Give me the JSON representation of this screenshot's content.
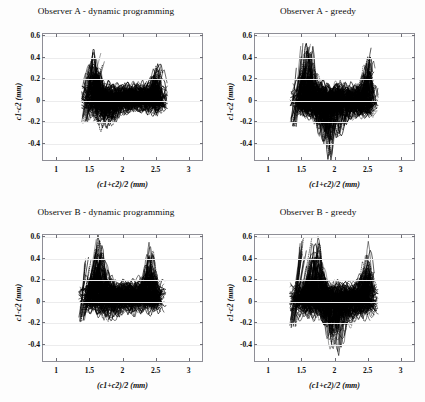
{
  "figure": {
    "background": "#fdfdfd",
    "rows": 2,
    "cols": 2
  },
  "axes": {
    "xlabel": "(c1+c2)/2 (mm)",
    "ylabel": "c1-c2 (mm)",
    "xticks": [
      "1",
      "1.5",
      "2",
      "2.5",
      "3"
    ],
    "xtick_values": [
      1,
      1.5,
      2,
      2.5,
      3
    ],
    "yticks": [
      "0.6",
      "0.4",
      "0.2",
      "0",
      "-0.2",
      "-0.4"
    ],
    "ytick_values": [
      0.6,
      0.4,
      0.2,
      0,
      -0.2,
      -0.4
    ],
    "xlim": [
      0.8,
      3.2
    ],
    "ylim": [
      -0.55,
      0.62
    ],
    "grid": true,
    "grid_color": "#ececed",
    "frame_color": "#8e8e96",
    "series_color": "#000000"
  },
  "chart_data": [
    {
      "type": "scatter",
      "panel": "top-left",
      "title": "Observer A - dynamic programming",
      "xlabel": "(c1+c2)/2 (mm)",
      "ylabel": "c1-c2 (mm)",
      "xlim": [
        0.8,
        3.2
      ],
      "ylim": [
        -0.55,
        0.62
      ],
      "xticks": [
        1,
        1.5,
        2,
        2.5,
        3
      ],
      "yticks": [
        -0.4,
        -0.2,
        0,
        0.2,
        0.4,
        0.6
      ],
      "grid": true,
      "legend": "none",
      "description": "Dense overplotted Bland-Altman agreement trace; many near-continuous curves forming a black band.",
      "cloud": {
        "x_range": [
          1.38,
          2.68
        ],
        "x_dense_range": [
          1.45,
          2.62
        ],
        "y_center": 0.02,
        "y_band": [
          -0.13,
          0.17
        ],
        "y_outlier_range": [
          -0.27,
          0.45
        ],
        "peak_x": 1.57,
        "peak_y": 0.44,
        "low_x": 1.72,
        "low_y": -0.27,
        "right_spike_x": 2.55,
        "right_spike_y": 0.4,
        "n_curves": 150,
        "points_per_curve": 60,
        "seed": 11
      }
    },
    {
      "type": "scatter",
      "panel": "top-right",
      "title": "Observer A - greedy",
      "xlabel": "(c1+c2)/2 (mm)",
      "ylabel": "c1-c2 (mm)",
      "xlim": [
        0.8,
        3.2
      ],
      "ylim": [
        -0.55,
        0.62
      ],
      "xticks": [
        1,
        1.5,
        2,
        2.5,
        3
      ],
      "yticks": [
        -0.4,
        -0.2,
        0,
        0.2,
        0.4,
        0.6
      ],
      "grid": true,
      "legend": "none",
      "description": "Funnel / V shaped dense cloud with steep left leading edge near 1.4 mm and a deep negative lobe near 1.9 mm.",
      "cloud": {
        "x_range": [
          1.33,
          2.66
        ],
        "x_dense_range": [
          1.42,
          2.6
        ],
        "y_center": 0.0,
        "y_band": [
          -0.16,
          0.16
        ],
        "y_outlier_range": [
          -0.5,
          0.54
        ],
        "peak_x": 1.6,
        "peak_y": 0.54,
        "low_x": 1.93,
        "low_y": -0.5,
        "right_spike_x": 2.53,
        "right_spike_y": 0.46,
        "n_curves": 165,
        "points_per_curve": 60,
        "seed": 23
      }
    },
    {
      "type": "scatter",
      "panel": "bottom-left",
      "title": "Observer B - dynamic programming",
      "xlabel": "(c1+c2)/2 (mm)",
      "ylabel": "c1-c2 (mm)",
      "xlim": [
        0.8,
        3.2
      ],
      "ylim": [
        -0.55,
        0.62
      ],
      "xticks": [
        1,
        1.5,
        2,
        2.5,
        3
      ],
      "yticks": [
        -0.4,
        -0.2,
        0,
        0.2,
        0.4,
        0.6
      ],
      "grid": true,
      "legend": "none",
      "description": "Compact black band slightly above zero with a tall narrow spike near 1.65 mm reaching 0.58.",
      "cloud": {
        "x_range": [
          1.34,
          2.66
        ],
        "x_dense_range": [
          1.42,
          2.6
        ],
        "y_center": 0.05,
        "y_band": [
          -0.11,
          0.2
        ],
        "y_outlier_range": [
          -0.17,
          0.58
        ],
        "peak_x": 1.66,
        "peak_y": 0.58,
        "low_x": 1.8,
        "low_y": -0.17,
        "right_spike_x": 2.42,
        "right_spike_y": 0.3,
        "n_curves": 155,
        "points_per_curve": 60,
        "seed": 37
      }
    },
    {
      "type": "scatter",
      "panel": "bottom-right",
      "title": "Observer B - greedy",
      "xlabel": "(c1+c2)/2 (mm)",
      "ylabel": "c1-c2 (mm)",
      "xlim": [
        0.8,
        3.2
      ],
      "ylim": [
        -0.55,
        0.62
      ],
      "xticks": [
        1,
        1.5,
        2,
        2.5,
        3
      ],
      "yticks": [
        -0.4,
        -0.2,
        0,
        0.2,
        0.4,
        0.6
      ],
      "grid": true,
      "legend": "none",
      "description": "Wide cloud with steep straight left edge rising to 0.6 and a broad negative tail down to -0.46 near 2.0 mm.",
      "cloud": {
        "x_range": [
          1.32,
          2.66
        ],
        "x_dense_range": [
          1.4,
          2.6
        ],
        "y_center": 0.03,
        "y_band": [
          -0.16,
          0.18
        ],
        "y_outlier_range": [
          -0.46,
          0.6
        ],
        "peak_x": 1.72,
        "peak_y": 0.6,
        "low_x": 2.02,
        "low_y": -0.46,
        "right_spike_x": 2.5,
        "right_spike_y": 0.28,
        "n_curves": 165,
        "points_per_curve": 60,
        "seed": 53
      }
    }
  ]
}
